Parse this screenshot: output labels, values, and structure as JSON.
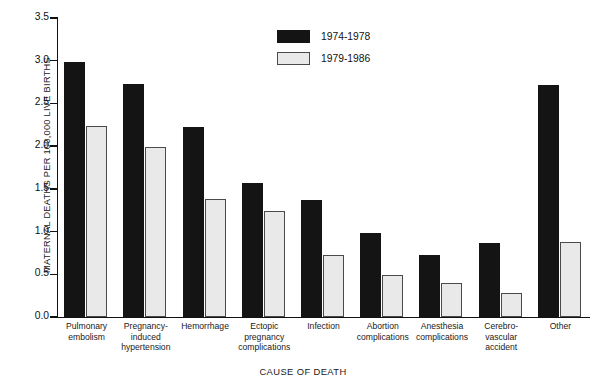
{
  "chart_data": {
    "type": "bar",
    "title": "",
    "xlabel": "CAUSE OF DEATH",
    "ylabel": "MATERNAL DEATHS PER 100,000 LIVE BIRTHS",
    "ylim": [
      0.0,
      3.5
    ],
    "yticks": [
      "0.0",
      "0.5",
      "1.0",
      "1.5",
      "2.0",
      "2.5",
      "3.0",
      "3.5"
    ],
    "ytick_values": [
      0.0,
      0.5,
      1.0,
      1.5,
      2.0,
      2.5,
      3.0,
      3.5
    ],
    "grid": false,
    "legend_position": "top-center",
    "categories": [
      "Pulmonary embolism",
      "Pregnancy-induced hypertension",
      "Hemorrhage",
      "Ectopic pregnancy complications",
      "Infection",
      "Abortion complications",
      "Anesthesia complications",
      "Cerebro-vascular accident",
      "Other"
    ],
    "category_lines": [
      [
        "Pulmonary",
        "embolism"
      ],
      [
        "Pregnancy-",
        "induced",
        "hypertension"
      ],
      [
        "Hemorrhage"
      ],
      [
        "Ectopic",
        "pregnancy",
        "complications"
      ],
      [
        "Infection"
      ],
      [
        "Abortion",
        "complications"
      ],
      [
        "Anesthesia",
        "complications"
      ],
      [
        "Cerebro-",
        "vascular",
        "accident"
      ],
      [
        "Other"
      ]
    ],
    "series": [
      {
        "name": "1974-1978",
        "color": "#141414",
        "values": [
          2.98,
          2.73,
          2.23,
          1.57,
          1.37,
          0.98,
          0.73,
          0.87,
          2.72
        ]
      },
      {
        "name": "1979-1986",
        "color": "#e9e9e9",
        "values": [
          2.24,
          1.99,
          1.38,
          1.24,
          0.73,
          0.49,
          0.4,
          0.28,
          0.88
        ]
      }
    ]
  },
  "legend": {
    "items": [
      {
        "label": "1974-1978",
        "style": "dark"
      },
      {
        "label": "1979-1986",
        "style": "light"
      }
    ]
  }
}
